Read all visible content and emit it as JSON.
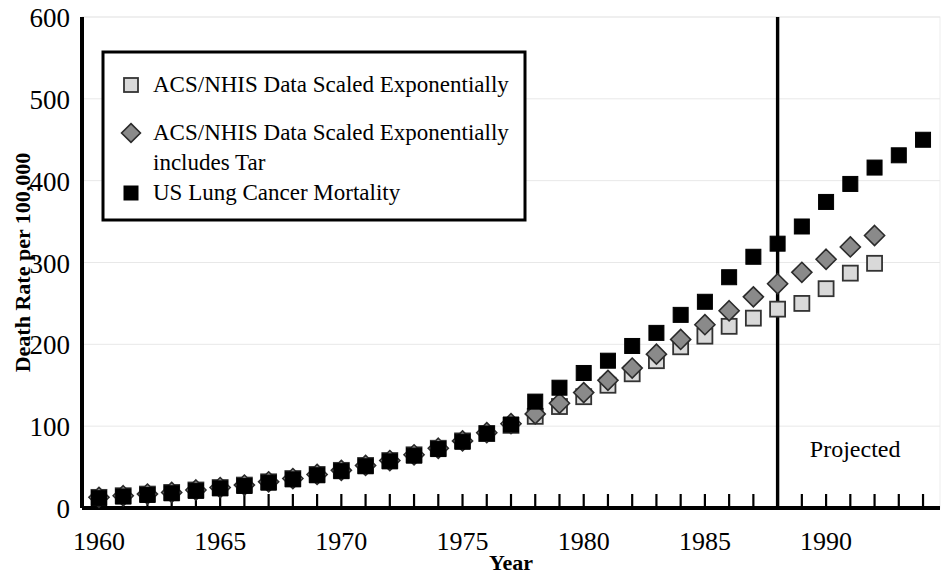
{
  "chart_data": {
    "type": "scatter",
    "title": "",
    "xlabel": "Year",
    "ylabel": "Death Rate per 100,000",
    "xlim": [
      1959.3,
      1994.7
    ],
    "ylim": [
      0,
      600
    ],
    "ytick_values": [
      0,
      100,
      200,
      300,
      400,
      500,
      600
    ],
    "ytick_labels": [
      "0",
      "100",
      "200",
      "300",
      "400",
      "500",
      "600"
    ],
    "xtick_labels": [
      "1960",
      "1965",
      "1970",
      "1975",
      "1980",
      "1985",
      "1990"
    ],
    "xtick_label_values": [
      1960,
      1965,
      1970,
      1975,
      1980,
      1985,
      1990
    ],
    "xtick_minor_step": 1,
    "grid": "horizontal-light",
    "legend_position": "upper-left-inside",
    "annotations": [
      {
        "name": "projection-divider",
        "type": "vline",
        "x": 1988,
        "label": ""
      },
      {
        "name": "projected-label",
        "type": "text",
        "text": "Projected",
        "x": 1991.2,
        "y": 62
      }
    ],
    "series": [
      {
        "name": "ACS/NHIS Data Scaled Exponentially",
        "marker": "square",
        "color": "#d9d9d9",
        "edge_color": "#333333",
        "x": [
          1960,
          1961,
          1962,
          1963,
          1964,
          1965,
          1966,
          1967,
          1968,
          1969,
          1970,
          1971,
          1972,
          1973,
          1974,
          1975,
          1976,
          1977,
          1978,
          1979,
          1980,
          1981,
          1982,
          1983,
          1984,
          1985,
          1986,
          1987,
          1988,
          1989,
          1990,
          1991,
          1992
        ],
        "values": [
          13,
          15,
          17,
          19,
          22,
          25,
          28,
          32,
          36,
          41,
          46,
          52,
          58,
          65,
          73,
          82,
          91,
          101,
          112,
          124,
          136,
          150,
          164,
          180,
          197,
          210,
          222,
          232,
          243,
          250,
          268,
          287,
          299
        ]
      },
      {
        "name": "ACS/NHIS Data Scaled Exponentially includes Tar",
        "marker": "diamond",
        "color": "#8a8a8a",
        "edge_color": "#2b2b2b",
        "x": [
          1960,
          1961,
          1962,
          1963,
          1964,
          1965,
          1966,
          1967,
          1968,
          1969,
          1970,
          1971,
          1972,
          1973,
          1974,
          1975,
          1976,
          1977,
          1978,
          1979,
          1980,
          1981,
          1982,
          1983,
          1984,
          1985,
          1986,
          1987,
          1988,
          1989,
          1990,
          1991,
          1992
        ],
        "values": [
          13,
          15,
          17,
          19,
          22,
          25,
          28,
          32,
          36,
          41,
          46,
          52,
          58,
          65,
          73,
          82,
          92,
          103,
          115,
          128,
          141,
          156,
          171,
          188,
          206,
          224,
          241,
          258,
          274,
          288,
          304,
          319,
          333
        ]
      },
      {
        "name": "US Lung Cancer Mortality",
        "marker": "square",
        "color": "#000000",
        "edge_color": "#000000",
        "x": [
          1960,
          1961,
          1962,
          1963,
          1964,
          1965,
          1966,
          1967,
          1968,
          1969,
          1970,
          1971,
          1972,
          1973,
          1974,
          1975,
          1976,
          1977,
          1978,
          1979,
          1980,
          1981,
          1982,
          1983,
          1984,
          1985,
          1986,
          1987,
          1988,
          1989,
          1990,
          1991,
          1992,
          1993,
          1994
        ],
        "values": [
          12,
          14,
          16,
          18,
          21,
          24,
          27,
          31,
          35,
          40,
          45,
          51,
          57,
          64,
          72,
          81,
          91,
          102,
          130,
          147,
          165,
          180,
          198,
          214,
          236,
          252,
          282,
          307,
          323,
          344,
          374,
          396,
          416,
          431,
          450
        ]
      }
    ]
  },
  "legend": {
    "entries": [
      {
        "label": "ACS/NHIS Data Scaled Exponentially",
        "marker": "square-light"
      },
      {
        "label": "ACS/NHIS Data Scaled Exponentially",
        "label2": "includes Tar",
        "marker": "diamond-gray"
      },
      {
        "label": "US Lung Cancer Mortality",
        "marker": "square-black"
      }
    ]
  }
}
